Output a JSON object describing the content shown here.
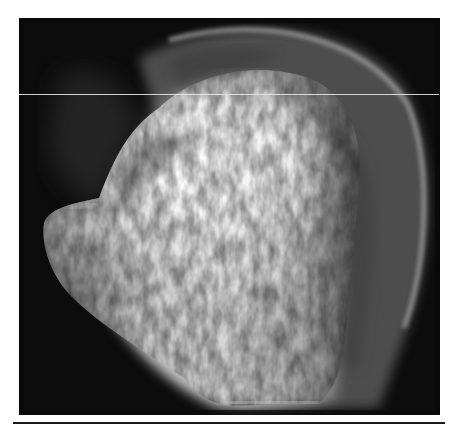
{
  "figure": {
    "type": "radiograph",
    "background_color": "#0c0c0c",
    "bone_highlight_color": "#f2f2f2",
    "bone_mid_color": "#9a9a9a"
  },
  "overlay": {
    "scan_line_color": "#e8e8e8"
  },
  "caption": {
    "text": "",
    "truncated": true
  }
}
